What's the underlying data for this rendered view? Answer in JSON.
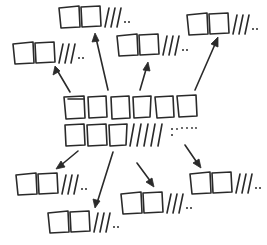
{
  "diagram": {
    "title": "",
    "style": "hand-drawn ink sketch",
    "colors": {
      "ink": "#2a2a2a",
      "background": "#ffffff"
    },
    "center": {
      "name": "central-pile",
      "row1": {
        "cards": 6
      },
      "row2": {
        "cards": 3,
        "tally_marks": 5,
        "ellipsis": "colon-dots"
      },
      "bbox": [
        63,
        95,
        198,
        146
      ]
    },
    "satellites": [
      {
        "id": "top-left",
        "cards": 2,
        "tally_marks": 3,
        "ellipsis": "..",
        "x": 12,
        "y": 42
      },
      {
        "id": "top-center",
        "cards": 2,
        "tally_marks": 3,
        "ellipsis": "..",
        "x": 58,
        "y": 6
      },
      {
        "id": "center-right",
        "cards": 2,
        "tally_marks": 3,
        "ellipsis": "..",
        "x": 116,
        "y": 34
      },
      {
        "id": "top-right",
        "cards": 2,
        "tally_marks": 3,
        "ellipsis": "..",
        "x": 186,
        "y": 13
      },
      {
        "id": "bottom-left",
        "cards": 2,
        "tally_marks": 3,
        "ellipsis": "..",
        "x": 15,
        "y": 173
      },
      {
        "id": "bottom-center-left",
        "cards": 2,
        "tally_marks": 3,
        "ellipsis": "..",
        "x": 47,
        "y": 211
      },
      {
        "id": "bottom-center-right",
        "cards": 2,
        "tally_marks": 3,
        "ellipsis": "..",
        "x": 120,
        "y": 192
      },
      {
        "id": "bottom-right",
        "cards": 2,
        "tally_marks": 3,
        "ellipsis": "..",
        "x": 189,
        "y": 172
      }
    ],
    "arrows": [
      {
        "to": "top-left",
        "from": [
          70,
          92
        ],
        "end": [
          55,
          67
        ]
      },
      {
        "to": "top-center",
        "from": [
          108,
          90
        ],
        "end": [
          95,
          34
        ]
      },
      {
        "to": "center-right",
        "from": [
          140,
          90
        ],
        "end": [
          148,
          63
        ]
      },
      {
        "to": "top-right",
        "from": [
          195,
          90
        ],
        "end": [
          218,
          38
        ]
      },
      {
        "to": "bottom-left",
        "from": [
          78,
          151
        ],
        "end": [
          57,
          168
        ]
      },
      {
        "to": "bottom-center-left",
        "from": [
          113,
          152
        ],
        "end": [
          96,
          207
        ]
      },
      {
        "to": "bottom-center-right",
        "from": [
          137,
          163
        ],
        "end": [
          153,
          186
        ]
      },
      {
        "to": "bottom-right",
        "from": [
          185,
          145
        ],
        "end": [
          200,
          167
        ]
      }
    ]
  }
}
